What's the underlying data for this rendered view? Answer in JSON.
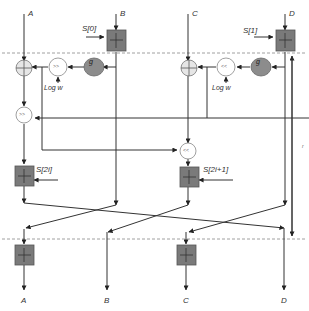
{
  "diagram": {
    "inputs": [
      "A",
      "B",
      "C",
      "D"
    ],
    "outputs": [
      "A",
      "B",
      "C",
      "D"
    ],
    "subkeys": {
      "s0": "S[0]",
      "s1": "S[1]",
      "s2i": "S[2i]",
      "s2i1": "S[2i+1]"
    },
    "operators": {
      "g_left": "g",
      "g_right": "g",
      "shift_right_1": ">>",
      "shift_left_1": "<<",
      "shift_right_2": ">>",
      "shift_left_2": "<<",
      "log_w_left": "Log w",
      "log_w_right": "Log w"
    },
    "side_label": "r",
    "colors": {
      "adder_fill": "#7a7a7a",
      "g_fill": "#8c8c8c",
      "xor_fill": "#e6e6e6",
      "line": "#333333",
      "dashed": "#888888"
    }
  }
}
